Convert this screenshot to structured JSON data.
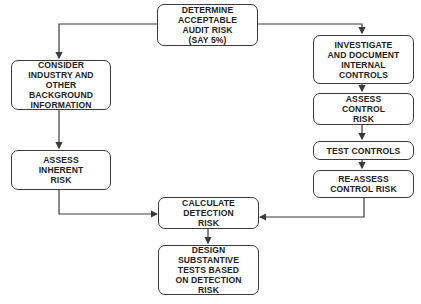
{
  "diagram": {
    "type": "flowchart",
    "nodes": [
      {
        "id": "determine",
        "label": "DETERMINE\nACCEPTABLE\nAUDIT RISK\n(SAY 5%)"
      },
      {
        "id": "consider",
        "label": "CONSIDER\nINDUSTRY AND\nOTHER\nBACKGROUND\nINFORMATION"
      },
      {
        "id": "inherent",
        "label": "ASSESS\nINHERENT\nRISK"
      },
      {
        "id": "investigate",
        "label": "INVESTIGATE\nAND DOCUMENT\nINTERNAL\nCONTROLS"
      },
      {
        "id": "control",
        "label": "ASSESS\nCONTROL\nRISK"
      },
      {
        "id": "test",
        "label": "TEST CONTROLS"
      },
      {
        "id": "reassess",
        "label": "RE-ASSESS\nCONTROL RISK"
      },
      {
        "id": "calculate",
        "label": "CALCULATE\nDETECTION\nRISK"
      },
      {
        "id": "design",
        "label": "DESIGN\nSUBSTANTIVE\nTESTS BASED\nON DETECTION\nRISK"
      }
    ],
    "edges": [
      {
        "from": "determine",
        "to": "consider"
      },
      {
        "from": "determine",
        "to": "investigate"
      },
      {
        "from": "consider",
        "to": "inherent"
      },
      {
        "from": "investigate",
        "to": "control"
      },
      {
        "from": "control",
        "to": "test"
      },
      {
        "from": "test",
        "to": "reassess"
      },
      {
        "from": "inherent",
        "to": "calculate"
      },
      {
        "from": "reassess",
        "to": "calculate"
      },
      {
        "from": "calculate",
        "to": "design"
      }
    ],
    "colors": {
      "line": "#3a3a3a",
      "text": "#222222",
      "background": "#ffffff"
    }
  }
}
